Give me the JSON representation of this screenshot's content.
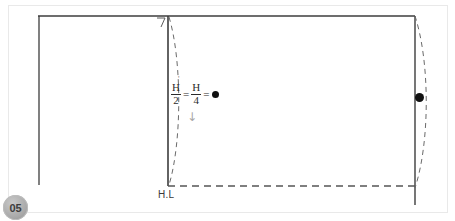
{
  "slide": {
    "badge_number": "05",
    "background_color": "#ffffff",
    "frame_color": "#e9e9e9"
  },
  "drawing": {
    "title": "perspective-construction-diagram",
    "stroke_color": "#444444",
    "dash_color": "#555555",
    "horizon_label": "H.L",
    "corner_tick_glyph": "7",
    "down_arrow_glyph": "↓",
    "prime_mark": "'"
  },
  "formula": {
    "first_numerator": "H",
    "first_denominator": "2",
    "equals_1": "=",
    "second_numerator": "H",
    "second_denominator": "4",
    "equals_2": "=",
    "result_symbol": "●"
  },
  "markers": {
    "center_dot": "●",
    "right_dot": "●"
  }
}
